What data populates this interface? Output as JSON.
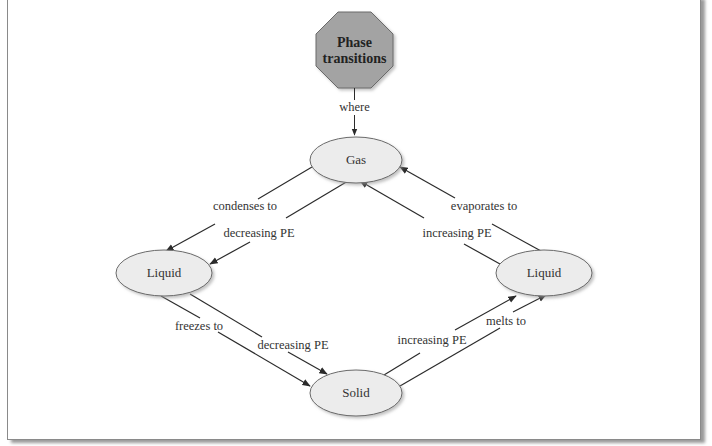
{
  "diagram": {
    "title_node": {
      "line1": "Phase",
      "line2": "transitions",
      "shape": "octagon",
      "fill": "#a3a3a3"
    },
    "title_link_label": "where",
    "nodes": {
      "gas": {
        "label": "Gas",
        "fill": "#ececec"
      },
      "liquid_left": {
        "label": "Liquid",
        "fill": "#ececec"
      },
      "liquid_right": {
        "label": "Liquid",
        "fill": "#ececec"
      },
      "solid": {
        "label": "Solid",
        "fill": "#ececec"
      }
    },
    "edges": {
      "condenses": {
        "label": "condenses to",
        "from": "Gas",
        "to": "Liquid"
      },
      "condenses_pe": {
        "label": "decreasing PE",
        "from": "Gas",
        "to": "Liquid"
      },
      "freezes": {
        "label": "freezes to",
        "from": "Liquid",
        "to": "Solid"
      },
      "freezes_pe": {
        "label": "decreasing PE",
        "from": "Liquid",
        "to": "Solid"
      },
      "melts_pe": {
        "label": "increasing PE",
        "from": "Solid",
        "to": "Liquid"
      },
      "melts": {
        "label": "melts to",
        "from": "Solid",
        "to": "Liquid"
      },
      "evaporates_pe": {
        "label": "increasing PE",
        "from": "Liquid",
        "to": "Gas"
      },
      "evaporates": {
        "label": "evaporates to",
        "from": "Liquid",
        "to": "Gas"
      }
    },
    "colors": {
      "line": "#2b2b2b",
      "text": "#333333",
      "border": "#8a8a8a"
    }
  }
}
